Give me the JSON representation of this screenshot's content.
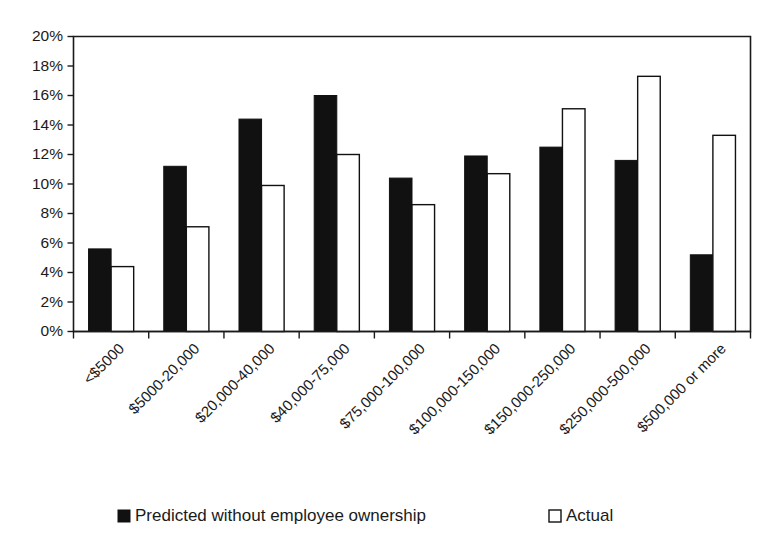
{
  "chart_data": {
    "type": "bar",
    "title": "",
    "subtitle": "",
    "xlabel": "",
    "ylabel": "",
    "grid": false,
    "legend_position": "bottom",
    "ylim": [
      0,
      20
    ],
    "ytick_step": 2,
    "ytick_labels": [
      "0%",
      "2%",
      "4%",
      "6%",
      "8%",
      "10%",
      "12%",
      "14%",
      "16%",
      "18%",
      "20%"
    ],
    "categories": [
      "<$5000",
      "$5000-20,000",
      "$20,000-40,000",
      "$40,000-75,000",
      "$75,000-100,000",
      "$100,000-150,000",
      "$150,000-250,000",
      "$250,000-500,000",
      "$500,000 or more"
    ],
    "series": [
      {
        "name": "Predicted without employee ownership",
        "color": "#111111",
        "style": "filled",
        "values": [
          5.6,
          11.2,
          14.4,
          16.0,
          10.4,
          11.9,
          12.5,
          11.6,
          5.2
        ]
      },
      {
        "name": "Actual",
        "color": "#ffffff",
        "style": "open",
        "values": [
          4.4,
          7.1,
          9.9,
          12.0,
          8.6,
          10.7,
          15.1,
          17.3,
          13.3
        ]
      }
    ]
  },
  "legend": {
    "entries": [
      {
        "label": "Predicted without employee ownership",
        "swatch": "filled-square"
      },
      {
        "label": "Actual",
        "swatch": "open-square"
      }
    ]
  },
  "colors": {
    "predicted": "#111111",
    "actual": "#ffffff",
    "axis": "#1a1a1a",
    "background": "#ffffff"
  }
}
